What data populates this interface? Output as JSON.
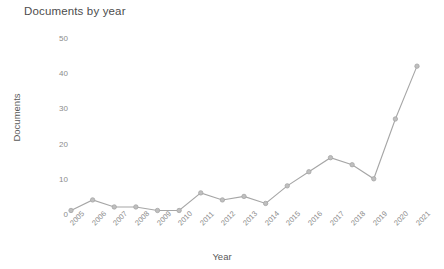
{
  "chart_data": {
    "type": "line",
    "title": "Documents by year",
    "xlabel": "Year",
    "ylabel": "Documents",
    "categories": [
      "2005",
      "2006",
      "2007",
      "2008",
      "2009",
      "2010",
      "2011",
      "2012",
      "2013",
      "2014",
      "2015",
      "2016",
      "2017",
      "2018",
      "2019",
      "2020",
      "2021"
    ],
    "values": [
      1,
      4,
      2,
      2,
      1,
      1,
      6,
      4,
      5,
      3,
      8,
      12,
      16,
      14,
      10,
      27,
      42
    ],
    "ylim": [
      0,
      50
    ],
    "yticks": [
      0,
      10,
      20,
      30,
      40,
      50
    ],
    "grid": false,
    "legend": false,
    "series_color": "#a6a6a6",
    "marker": "circle"
  }
}
